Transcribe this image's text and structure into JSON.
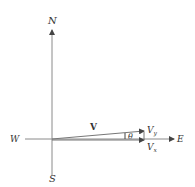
{
  "diagram": {
    "axes": {
      "north_label": "N",
      "south_label": "S",
      "west_label": "W",
      "east_label": "E"
    },
    "vector": {
      "label": "V",
      "angle_label": "θ",
      "component_y_label": "V",
      "component_y_sub": "y",
      "component_x_label": "V",
      "component_x_sub": "x"
    },
    "colors": {
      "line": "#8a8a8a",
      "text": "#333333"
    }
  }
}
